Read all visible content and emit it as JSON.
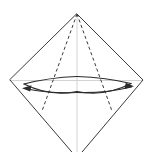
{
  "diagram": {
    "type": "origami-fold-instruction",
    "canvas": {
      "width": 152,
      "height": 152,
      "background": "#ffffff"
    },
    "colors": {
      "solid_edge": "#3a3a3a",
      "dashed_crease": "#3a3a3a",
      "faint_crease": "#c8c8c8",
      "arrow": "#2b2b2b"
    },
    "vertices": {
      "apex_top": {
        "x": 77,
        "y": 14
      },
      "corner_left": {
        "x": 10,
        "y": 80
      },
      "corner_right": {
        "x": 143,
        "y": 80
      },
      "bottom_offscreen": {
        "x": 77,
        "y": 158
      }
    },
    "shapes": {
      "outline_label": "diamond-outline",
      "outline_path": "M 77 14 L 143 80 L 77 158 L 10 80 Z",
      "center_vertical_label": "center-vertical-crease",
      "center_vertical_path": "M 77 14 L 77 152",
      "horizontal_label": "horizontal-crease",
      "horizontal_path": "M 11 80.5 L 142 80.5"
    },
    "creases": [
      {
        "name": "dashed-crease-left",
        "style": "dashed",
        "from": {
          "x": 77,
          "y": 14
        },
        "to": {
          "x": 42,
          "y": 111
        },
        "path": "M 77 14 L 42 111"
      },
      {
        "name": "dashed-crease-right",
        "style": "dashed",
        "from": {
          "x": 77,
          "y": 14
        },
        "to": {
          "x": 112,
          "y": 111
        },
        "path": "M 77 14 L 112 111"
      }
    ],
    "arrows": [
      {
        "name": "fold-arrow-left",
        "direction": "left",
        "curve_path": "M 77 92.5 Q 52 94 25 88.5",
        "tip": {
          "x": 22,
          "y": 88
        },
        "head_points": "22,88.2 31.5,85.2 30.2,91.6"
      },
      {
        "name": "fold-arrow-right",
        "direction": "right",
        "curve_path": "M 77 92.5 Q 104 93.5 131.5 87",
        "tip": {
          "x": 134,
          "y": 86.3
        },
        "head_points": "134,86.3 124.4,89 125.8,82.8"
      }
    ],
    "bow_curves": [
      {
        "name": "bow-curve-upper-left",
        "path": "M 24 84 Q 50 97 77 91.5"
      },
      {
        "name": "bow-curve-upper-right",
        "path": "M 77 91.5 Q 105 97 131 83.5"
      },
      {
        "name": "bow-curve-lower-left",
        "path": "M 24 84 Q 49 77.5 77 76.5"
      },
      {
        "name": "bow-curve-lower-right",
        "path": "M 77 76.5 Q 106 77.5 131 83.5"
      }
    ]
  }
}
